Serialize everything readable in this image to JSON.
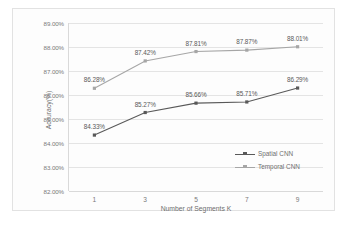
{
  "chart_data": {
    "type": "line",
    "title": "",
    "xlabel": "Number of Segments K",
    "ylabel": "Accuracy(%)",
    "categories": [
      "1",
      "3",
      "5",
      "7",
      "9"
    ],
    "ylim": [
      82.0,
      89.0
    ],
    "ytick_labels": [
      "89.00%",
      "88.00%",
      "87.00%",
      "86.00%",
      "85.00%",
      "84.00%",
      "83.00%",
      "82.00%"
    ],
    "ytick_values": [
      89.0,
      88.0,
      87.0,
      86.0,
      85.0,
      84.0,
      83.0,
      82.0
    ],
    "grid": "horizontal",
    "legend_position": "inside-right",
    "series": [
      {
        "name": "Spatial CNN",
        "color": "#595959",
        "marker": "square",
        "values": [
          84.33,
          85.27,
          85.66,
          85.71,
          86.29
        ],
        "labels": [
          "84.33%",
          "85.27%",
          "85.66%",
          "85.71%",
          "86.29%"
        ]
      },
      {
        "name": "Temporal CNN",
        "color": "#a6a6a6",
        "marker": "square",
        "values": [
          86.28,
          87.42,
          87.81,
          87.87,
          88.01
        ],
        "labels": [
          "86.28%",
          "87.42%",
          "87.81%",
          "87.87%",
          "88.01%"
        ]
      }
    ]
  }
}
